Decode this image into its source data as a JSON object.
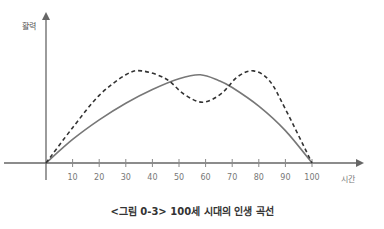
{
  "chart_data": {
    "type": "line",
    "title": "<그림 0-3> 100세 시대의 인생 곡선",
    "xlabel": "시간",
    "ylabel": "활력",
    "xlim": [
      0,
      100
    ],
    "x_ticks": [
      10,
      20,
      30,
      40,
      50,
      60,
      70,
      80,
      90,
      100
    ],
    "grid": false,
    "legend": null,
    "series": [
      {
        "name": "solid",
        "style": "solid",
        "color": "#777777",
        "x": [
          0,
          10,
          20,
          30,
          40,
          50,
          58,
          65,
          70,
          80,
          90,
          100
        ],
        "y": [
          0,
          24,
          44,
          61,
          75,
          86,
          90,
          84,
          77,
          58,
          33,
          0
        ]
      },
      {
        "name": "dashed",
        "style": "dashed",
        "color": "#333333",
        "x": [
          0,
          10,
          20,
          30,
          36,
          45,
          52,
          59,
          66,
          72,
          78,
          84,
          90,
          100
        ],
        "y": [
          0,
          36,
          69,
          90,
          94,
          86,
          70,
          62,
          71,
          88,
          94,
          84,
          55,
          0
        ]
      }
    ]
  },
  "labels": {
    "ylabel": "활력",
    "xlabel": "시간",
    "caption": "<그림 0-3> 100세 시대의 인생 곡선",
    "ticks": [
      "10",
      "20",
      "30",
      "40",
      "50",
      "60",
      "70",
      "80",
      "90",
      "100"
    ]
  }
}
